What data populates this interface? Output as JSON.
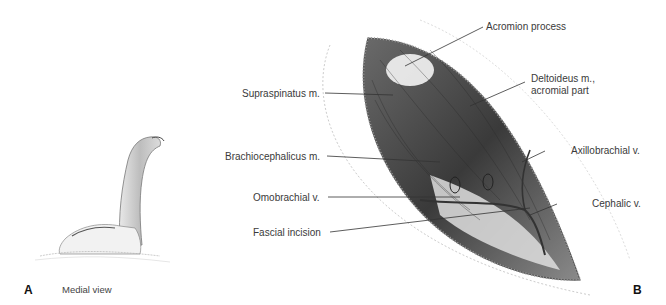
{
  "figure": {
    "panel_a": {
      "letter": "A",
      "caption": "Medial view"
    },
    "panel_b": {
      "letter": "B",
      "labels": {
        "acromion": "Acromion process",
        "supraspinatus": "Supraspinatus m.",
        "deltoideus_1": "Deltoideus m.,",
        "deltoideus_2": "acromial part",
        "brachiocephalicus": "Brachiocephalicus m.",
        "axillobrachial": "Axillobrachial v.",
        "omobrachial": "Omobrachial v.",
        "cephalic": "Cephalic v.",
        "fascial": "Fascial incision"
      }
    }
  }
}
